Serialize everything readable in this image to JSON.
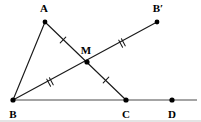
{
  "figure": {
    "background_color": "#ffffff",
    "stroke_color": "#1a1a1a",
    "axis_color": "#4a4a4a",
    "width": 201,
    "height": 122,
    "points": [
      {
        "id": "A",
        "label": "A",
        "x": 45,
        "y": 22,
        "label_x": 44,
        "label_y": 8,
        "dot_r": 2.4
      },
      {
        "id": "B",
        "label": "B",
        "x": 13,
        "y": 100,
        "label_x": 13,
        "label_y": 114,
        "dot_r": 2.6
      },
      {
        "id": "M",
        "label": "M",
        "x": 87,
        "y": 62,
        "label_x": 86,
        "label_y": 50,
        "dot_r": 2.6
      },
      {
        "id": "Bp",
        "label": "B′",
        "x": 157,
        "y": 22,
        "label_x": 158,
        "label_y": 8,
        "dot_r": 2.4
      },
      {
        "id": "C",
        "label": "C",
        "x": 126,
        "y": 100,
        "label_x": 126,
        "label_y": 114,
        "dot_r": 2.6
      },
      {
        "id": "D",
        "label": "D",
        "x": 172,
        "y": 100,
        "label_x": 172,
        "label_y": 114,
        "dot_r": 2.6
      }
    ],
    "segments": [
      {
        "id": "AB",
        "from": "A",
        "to": "B",
        "x1": 45,
        "y1": 22,
        "x2": 13,
        "y2": 100
      },
      {
        "id": "AC",
        "from": "A",
        "to": "C",
        "x1": 45,
        "y1": 22,
        "x2": 126,
        "y2": 100
      },
      {
        "id": "BBp",
        "from": "B",
        "to": "Bp",
        "x1": 13,
        "y1": 100,
        "x2": 157,
        "y2": 22
      }
    ],
    "ray": {
      "id": "BD-line",
      "from": "B",
      "through": "D",
      "x1": 13,
      "y1": 100,
      "x2": 197,
      "y2": 100
    },
    "tick_marks": [
      {
        "id": "tick-AM",
        "segment": "AM",
        "count": 1,
        "x": 63,
        "y": 40,
        "angle_deg": 44
      },
      {
        "id": "tick-MC",
        "segment": "MC",
        "count": 1,
        "x": 106,
        "y": 80,
        "angle_deg": 44
      },
      {
        "id": "tick-BM",
        "segment": "BM",
        "count": 2,
        "x": 50,
        "y": 82,
        "angle_deg": -28
      },
      {
        "id": "tick-MBp",
        "segment": "MB′",
        "count": 2,
        "x": 122,
        "y": 43,
        "angle_deg": -28
      }
    ],
    "bottom_rule": {
      "x1": 0,
      "y1": 121,
      "x2": 201,
      "y2": 121
    }
  }
}
